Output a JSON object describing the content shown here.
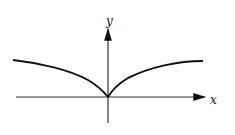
{
  "diagram": {
    "type": "function-graph",
    "axes": {
      "x_label": "x",
      "y_label": "y"
    },
    "colors": {
      "curve": "#111111",
      "axes": "#222222",
      "background": "#ffffff"
    }
  }
}
